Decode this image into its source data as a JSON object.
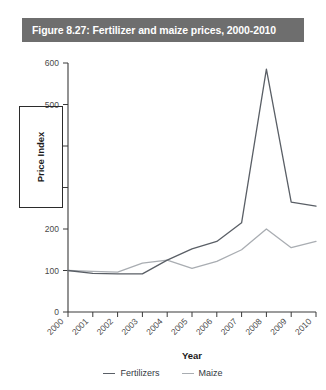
{
  "figure": {
    "title": "Figure 8.27: Fertilizer and maize prices, 2000-2010",
    "title_bar_color": "#6e6e6e",
    "title_text_color": "#ffffff"
  },
  "axes": {
    "y_title": "Price Index",
    "x_title": "Year",
    "y_ticks": [
      "0",
      "100",
      "200",
      "300",
      "400",
      "500",
      "600"
    ],
    "y_ticks_visible": [
      "0",
      "100",
      "200",
      "500",
      "600"
    ],
    "x_ticks": [
      "2000",
      "2001",
      "2002",
      "2003",
      "2004",
      "2005",
      "2006",
      "2007",
      "2008",
      "2009",
      "2010"
    ]
  },
  "legend": {
    "items": [
      {
        "label": "Fertilizers",
        "color": "#5a5f66"
      },
      {
        "label": "Maize",
        "color": "#a9adb2"
      }
    ]
  },
  "chart_data": {
    "type": "line",
    "title": "Figure 8.27: Fertilizer and maize prices, 2000-2010",
    "xlabel": "Year",
    "ylabel": "Price Index",
    "categories": [
      "2000",
      "2001",
      "2002",
      "2003",
      "2004",
      "2005",
      "2006",
      "2007",
      "2008",
      "2009",
      "2010"
    ],
    "x": [
      2000,
      2001,
      2002,
      2003,
      2004,
      2005,
      2006,
      2007,
      2008,
      2009,
      2010
    ],
    "xlim": [
      2000,
      2010
    ],
    "ylim": [
      0,
      600
    ],
    "ytick_step": 100,
    "grid": false,
    "legend_position": "bottom",
    "series": [
      {
        "name": "Fertilizers",
        "color": "#5a5f66",
        "values": [
          100,
          93,
          92,
          92,
          125,
          152,
          170,
          215,
          585,
          265,
          255
        ]
      },
      {
        "name": "Maize",
        "color": "#a9adb2",
        "values": [
          100,
          98,
          96,
          118,
          125,
          105,
          122,
          150,
          200,
          155,
          170
        ]
      }
    ]
  }
}
